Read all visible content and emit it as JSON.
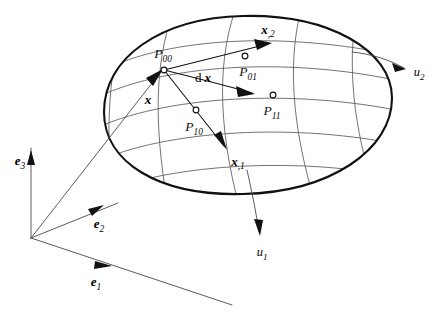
{
  "figure": {
    "background_color": "#ffffff",
    "outline_color": "#111111",
    "grid_color": "#5a5a5a"
  },
  "surface": {
    "boundary_name": "surface-outline-ellipse",
    "grid_name": "curvilinear-grid"
  },
  "points": [
    {
      "id": "P00",
      "base": "P",
      "sub": "00"
    },
    {
      "id": "P01",
      "base": "P",
      "sub": "01"
    },
    {
      "id": "P10",
      "base": "P",
      "sub": "10"
    },
    {
      "id": "P11",
      "base": "P",
      "sub": "11"
    }
  ],
  "vectors": [
    {
      "id": "x",
      "base": "x",
      "sub": "",
      "name": "position-vector-x"
    },
    {
      "id": "dx",
      "prefix": "d",
      "base": "x",
      "sub": "",
      "name": "differential-vector-dx"
    },
    {
      "id": "x1",
      "base": "x",
      "sub": ",1",
      "name": "tangent-vector-x-comma-1"
    },
    {
      "id": "x2",
      "base": "x",
      "sub": ",2",
      "name": "tangent-vector-x-comma-2"
    }
  ],
  "basis": [
    {
      "id": "e1",
      "base": "e",
      "sub": "1",
      "name": "basis-vector-e1"
    },
    {
      "id": "e2",
      "base": "e",
      "sub": "2",
      "name": "basis-vector-e2"
    },
    {
      "id": "e3",
      "base": "e",
      "sub": "3",
      "name": "basis-vector-e3"
    }
  ],
  "parameters": [
    {
      "id": "u1",
      "base": "u",
      "sub": "1",
      "name": "coordinate-line-u1"
    },
    {
      "id": "u2",
      "base": "u",
      "sub": "2",
      "name": "coordinate-line-u2"
    }
  ]
}
